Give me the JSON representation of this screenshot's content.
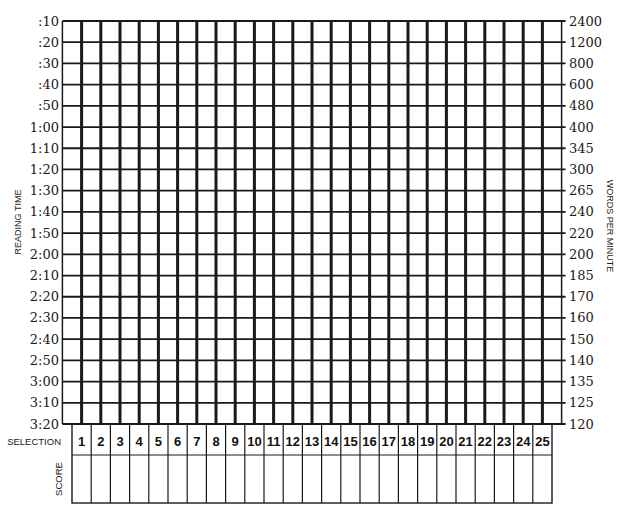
{
  "chart_data": {
    "type": "table",
    "title": "",
    "ylabel_left": "READING TIME",
    "ylabel_right": "WORDS PER MINUTE",
    "xlabel": "SELECTION",
    "score_label": "SCORE",
    "grid": true,
    "reading_times": [
      ":10",
      ":20",
      ":30",
      ":40",
      ":50",
      "1:00",
      "1:10",
      "1:20",
      "1:30",
      "1:40",
      "1:50",
      "2:00",
      "2:10",
      "2:20",
      "2:30",
      "2:40",
      "2:50",
      "3:00",
      "3:10",
      "3:20"
    ],
    "words_per_minute": [
      "2400",
      "1200",
      "800",
      "600",
      "480",
      "400",
      "345",
      "300",
      "265",
      "240",
      "220",
      "200",
      "185",
      "170",
      "160",
      "150",
      "140",
      "135",
      "125",
      "120"
    ],
    "selections": [
      "1",
      "2",
      "3",
      "4",
      "5",
      "6",
      "7",
      "8",
      "9",
      "10",
      "11",
      "12",
      "13",
      "14",
      "15",
      "16",
      "17",
      "18",
      "19",
      "20",
      "21",
      "22",
      "23",
      "24",
      "25"
    ],
    "scores": [
      "",
      "",
      "",
      "",
      "",
      "",
      "",
      "",
      "",
      "",
      "",
      "",
      "",
      "",
      "",
      "",
      "",
      "",
      "",
      "",
      "",
      "",
      "",
      "",
      ""
    ],
    "series": []
  },
  "labels": {
    "reading_time": "READING TIME",
    "words_per_minute": "WORDS PER MINUTE",
    "selection": "SELECTION",
    "score": "SCORE"
  },
  "colors": {
    "ink": "#1a1a1a",
    "background": "#ffffff"
  }
}
